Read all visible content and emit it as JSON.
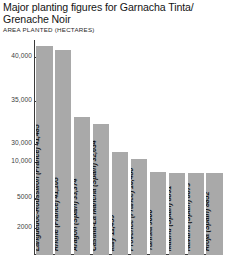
{
  "header": {
    "title": "Major planting figures for Garnacha Tinta/ Grenache Noir",
    "subtitle": "AREA PLANTED (HECTARES)"
  },
  "colors": {
    "bar_fill": "#a9a9a9",
    "axis": "#3a3a3a",
    "text": "#141414",
    "background": "#ffffff"
  },
  "chart_data": {
    "type": "bar",
    "title": "Major planting figures for Garnacha Tinta/ Grenache Noir",
    "subtitle": "AREA PLANTED (HECTARES)",
    "xlabel": "",
    "ylabel": "AREA PLANTED (HECTARES)",
    "grid": false,
    "legend": "none",
    "axis_scale": "non-linear (broken axis)",
    "yticks": [
      {
        "label": "40,000",
        "value": 40000,
        "pos_pct": 92.3
      },
      {
        "label": "35,000",
        "value": 35000,
        "pos_pct": 71.6
      },
      {
        "label": "30,000",
        "value": 30000,
        "pos_pct": 51.5
      },
      {
        "label": "10,000",
        "value": 10000,
        "pos_pct": 43.4
      },
      {
        "label": "5000",
        "value": 5000,
        "pos_pct": 26.3
      },
      {
        "label": "2000",
        "value": 2000,
        "pos_pct": 12.6
      }
    ],
    "categories": [
      "Languedoc-Roussillon (France)",
      "Rhône (France)",
      "Aragón (Spain)",
      "Castilla-La Mancha (Spain)",
      "Italy",
      "Provence (France)",
      "Tunisia",
      "Madrid (Spain)",
      "Navarra (Spain)",
      "Rioja (Spain)"
    ],
    "values": [
      41485,
      41105,
      33374,
      32634,
      11459,
      10486,
      9000,
      8891,
      8873,
      8852
    ],
    "bars": [
      {
        "label": "Languedoc-Roussillon (France) 41,485",
        "region": "Languedoc-Roussillon (France)",
        "value": 41485,
        "value_text": "41,485",
        "height_pct": 97.0
      },
      {
        "label": "Rhône (France) 41,105",
        "region": "Rhône (France)",
        "value": 41105,
        "value_text": "41,105",
        "height_pct": 95.4
      },
      {
        "label": "Aragón (Spain) 33,374",
        "region": "Aragón (Spain)",
        "value": 33374,
        "value_text": "33,374",
        "height_pct": 64.0
      },
      {
        "label": "Castilla-La Mancha (Spain) 32,634",
        "region": "Castilla-La Mancha (Spain)",
        "value": 32634,
        "value_text": "32,634",
        "height_pct": 60.8
      },
      {
        "label": "Italy 11,459",
        "region": "Italy",
        "value": 11459,
        "value_text": "11,459",
        "height_pct": 47.8
      },
      {
        "label": "Provence (France) 10,486",
        "region": "Provence (France)",
        "value": 10486,
        "value_text": "10,486",
        "height_pct": 44.5
      },
      {
        "label": "Tunisia 9000",
        "region": "Tunisia",
        "value": 9000,
        "value_text": "9000",
        "height_pct": 38.8
      },
      {
        "label": "Madrid (Spain) 8891",
        "region": "Madrid (Spain)",
        "value": 8891,
        "value_text": "8891",
        "height_pct": 38.3
      },
      {
        "label": "Navarra (Spain) 8873",
        "region": "Navarra (Spain)",
        "value": 8873,
        "value_text": "8873",
        "height_pct": 38.2
      },
      {
        "label": "Rioja (Spain) 8852",
        "region": "Rioja (Spain)",
        "value": 8852,
        "value_text": "8852",
        "height_pct": 38.1
      }
    ]
  }
}
